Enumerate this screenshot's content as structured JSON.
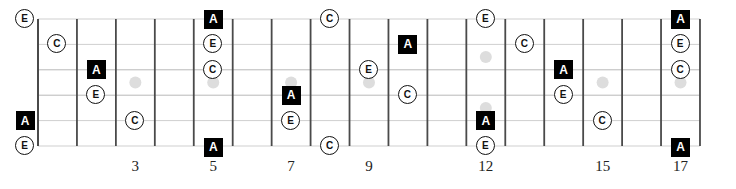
{
  "diagram": {
    "type": "guitar-fretboard",
    "legend_note_shapes": {
      "A": "filled-square",
      "C": "circle",
      "E": "circle"
    },
    "colors": {
      "fret_line": "#4a4a4a",
      "string_line": "#cfcfcf",
      "inlay_dot": "#dddddd",
      "root_fill": "#000000",
      "note_outline": "#111111"
    },
    "fret_count": 17,
    "strings": [
      "e",
      "B",
      "G",
      "D",
      "A",
      "E"
    ],
    "fret_labels": [
      {
        "fret": 3,
        "label": "3"
      },
      {
        "fret": 5,
        "label": "5"
      },
      {
        "fret": 7,
        "label": "7"
      },
      {
        "fret": 9,
        "label": "9"
      },
      {
        "fret": 12,
        "label": "12"
      },
      {
        "fret": 15,
        "label": "15"
      },
      {
        "fret": 17,
        "label": "17"
      }
    ],
    "inlays": [
      {
        "fret": 3,
        "pos": "mid"
      },
      {
        "fret": 5,
        "pos": "mid"
      },
      {
        "fret": 7,
        "pos": "mid"
      },
      {
        "fret": 9,
        "pos": "mid"
      },
      {
        "fret": 12,
        "pos": "upper"
      },
      {
        "fret": 12,
        "pos": "lower"
      },
      {
        "fret": 15,
        "pos": "mid"
      },
      {
        "fret": 17,
        "pos": "mid"
      }
    ],
    "notes": [
      {
        "string": 1,
        "fret": 0,
        "label": "E",
        "shape": "circle"
      },
      {
        "string": 1,
        "fret": 5,
        "label": "A",
        "shape": "square"
      },
      {
        "string": 1,
        "fret": 8,
        "label": "C",
        "shape": "circle"
      },
      {
        "string": 1,
        "fret": 12,
        "label": "E",
        "shape": "circle"
      },
      {
        "string": 1,
        "fret": 17,
        "label": "A",
        "shape": "square"
      },
      {
        "string": 2,
        "fret": 1,
        "label": "C",
        "shape": "circle"
      },
      {
        "string": 2,
        "fret": 5,
        "label": "E",
        "shape": "circle"
      },
      {
        "string": 2,
        "fret": 10,
        "label": "A",
        "shape": "square"
      },
      {
        "string": 2,
        "fret": 13,
        "label": "C",
        "shape": "circle"
      },
      {
        "string": 2,
        "fret": 17,
        "label": "E",
        "shape": "circle"
      },
      {
        "string": 3,
        "fret": 2,
        "label": "A",
        "shape": "square"
      },
      {
        "string": 3,
        "fret": 5,
        "label": "C",
        "shape": "circle"
      },
      {
        "string": 3,
        "fret": 9,
        "label": "E",
        "shape": "circle"
      },
      {
        "string": 3,
        "fret": 14,
        "label": "A",
        "shape": "square"
      },
      {
        "string": 3,
        "fret": 17,
        "label": "C",
        "shape": "circle"
      },
      {
        "string": 4,
        "fret": 2,
        "label": "E",
        "shape": "circle"
      },
      {
        "string": 4,
        "fret": 7,
        "label": "A",
        "shape": "square"
      },
      {
        "string": 4,
        "fret": 10,
        "label": "C",
        "shape": "circle"
      },
      {
        "string": 4,
        "fret": 14,
        "label": "E",
        "shape": "circle"
      },
      {
        "string": 5,
        "fret": 0,
        "label": "A",
        "shape": "square"
      },
      {
        "string": 5,
        "fret": 3,
        "label": "C",
        "shape": "circle"
      },
      {
        "string": 5,
        "fret": 7,
        "label": "E",
        "shape": "circle"
      },
      {
        "string": 5,
        "fret": 12,
        "label": "A",
        "shape": "square"
      },
      {
        "string": 5,
        "fret": 15,
        "label": "C",
        "shape": "circle"
      },
      {
        "string": 6,
        "fret": 0,
        "label": "E",
        "shape": "circle"
      },
      {
        "string": 6,
        "fret": 5,
        "label": "A",
        "shape": "square"
      },
      {
        "string": 6,
        "fret": 8,
        "label": "C",
        "shape": "circle"
      },
      {
        "string": 6,
        "fret": 12,
        "label": "E",
        "shape": "circle"
      },
      {
        "string": 6,
        "fret": 17,
        "label": "A",
        "shape": "square"
      }
    ]
  }
}
